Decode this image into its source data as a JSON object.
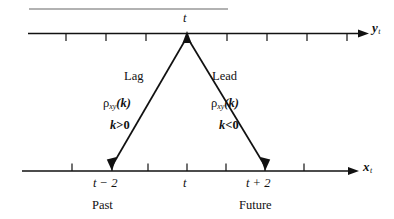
{
  "figure": {
    "title_rule": "horizontal-rule",
    "colors": {
      "ink": "#111111",
      "background": "#ffffff",
      "rule": "#666666"
    },
    "top_axis": {
      "name": "y-axis",
      "label_var": "y",
      "label_sub": "t",
      "apex_tick_label": "t",
      "tick_count": 9,
      "arrow": "right"
    },
    "bottom_axis": {
      "name": "x-axis",
      "label_var": "x",
      "label_sub": "t",
      "arrow": "right",
      "tick_count": 9,
      "ticks": [
        {
          "label": "t − 2",
          "era": "Past"
        },
        {
          "label": "t",
          "era": ""
        },
        {
          "label": "t + 2",
          "era": "Future"
        }
      ]
    },
    "left_branch": {
      "name": "lag-branch",
      "heading": "Lag",
      "rho": "ρ",
      "rho_sub": "xy",
      "rho_arg": "(k)",
      "condition_var": "k",
      "condition_op": ">",
      "condition_val": "0",
      "era": "Past"
    },
    "right_branch": {
      "name": "lead-branch",
      "heading": "Lead",
      "rho": "ρ",
      "rho_sub": "xy",
      "rho_arg": "(k)",
      "condition_var": "k",
      "condition_op": "<",
      "condition_val": "0",
      "era": "Future"
    }
  }
}
